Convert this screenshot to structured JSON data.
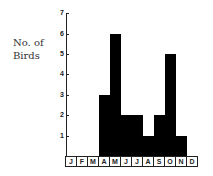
{
  "chart_data": {
    "type": "bar",
    "title": "",
    "xlabel": "",
    "ylabel": "No. of Birds",
    "ylabel_lines": [
      "No. of",
      "Birds"
    ],
    "categories": [
      "J",
      "F",
      "M",
      "A",
      "M",
      "J",
      "J",
      "A",
      "S",
      "O",
      "N",
      "D"
    ],
    "values": [
      0,
      0,
      0,
      3,
      6,
      2,
      2,
      1,
      2,
      5,
      1,
      0
    ],
    "ylim": [
      0,
      7
    ],
    "yticks": [
      1,
      2,
      3,
      4,
      5,
      6,
      7
    ],
    "grid": false,
    "legend": null
  }
}
